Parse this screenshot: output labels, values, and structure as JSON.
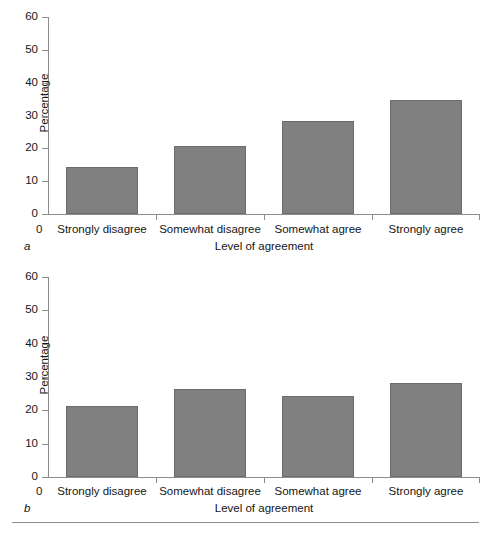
{
  "chart_data": [
    {
      "type": "bar",
      "panel_letter": "a",
      "title": "",
      "xlabel": "Level of agreement",
      "ylabel": "Percentage",
      "categories": [
        "Strongly disagree",
        "Somewhat disagree",
        "Somewhat agree",
        "Strongly agree"
      ],
      "values": [
        14.4,
        20.8,
        28.2,
        34.6
      ],
      "ylim": [
        0,
        60
      ],
      "yticks": [
        0,
        10,
        20,
        30,
        40,
        50,
        60
      ],
      "ytick_labels": [
        "0",
        "10",
        "20",
        "30",
        "40",
        "50",
        "60"
      ],
      "origin_label": "0",
      "grid": false,
      "legend": "none",
      "bar_color": "#808080",
      "axis_color": "#8d8d8d"
    },
    {
      "type": "bar",
      "panel_letter": "b",
      "title": "",
      "xlabel": "Level of agreement",
      "ylabel": "Percentage",
      "categories": [
        "Strongly disagree",
        "Somewhat disagree",
        "Somewhat agree",
        "Strongly agree"
      ],
      "values": [
        21.2,
        26.4,
        24.3,
        28.2
      ],
      "ylim": [
        0,
        60
      ],
      "yticks": [
        0,
        10,
        20,
        30,
        40,
        50,
        60
      ],
      "ytick_labels": [
        "0",
        "10",
        "20",
        "30",
        "40",
        "50",
        "60"
      ],
      "origin_label": "0",
      "grid": false,
      "legend": "none",
      "bar_color": "#808080",
      "axis_color": "#8d8d8d"
    }
  ],
  "panel_a": {
    "letter": "a",
    "ylabel": "Percentage",
    "xlabel": "Level of agreement",
    "origin_label": "0",
    "ytick_labels": [
      "60",
      "50",
      "40",
      "30",
      "20",
      "10",
      "0"
    ],
    "categories": [
      "Strongly disagree",
      "Somewhat disagree",
      "Somewhat agree",
      "Strongly agree"
    ]
  },
  "panel_b": {
    "letter": "b",
    "ylabel": "Percentage",
    "xlabel": "Level of agreement",
    "origin_label": "0",
    "ytick_labels": [
      "60",
      "50",
      "40",
      "30",
      "20",
      "10",
      "0"
    ],
    "categories": [
      "Strongly disagree",
      "Somewhat disagree",
      "Somewhat agree",
      "Strongly agree"
    ]
  }
}
